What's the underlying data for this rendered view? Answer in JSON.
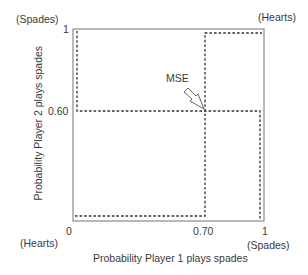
{
  "diagram": {
    "title": "",
    "x_axis": {
      "label": "Probability Player 1 plays spades",
      "ticks": [
        "0",
        "0.70",
        "1"
      ],
      "end_labels": {
        "left": "(Hearts)",
        "right": "(Spades)"
      }
    },
    "y_axis": {
      "label": "Probability Player 2 plays spades",
      "ticks": [
        "0",
        "0.60",
        "1"
      ],
      "end_labels": {
        "top": "(Spades)",
        "bottom": "(Hearts)"
      }
    },
    "corner_labels": {
      "top_left": "(Spades)",
      "top_right": "(Hearts)",
      "bottom_left": "(Hearts)",
      "bottom_right": "(Spades)"
    },
    "annotation": {
      "label": "MSE",
      "points_to": [
        0.7,
        0.6
      ]
    },
    "best_response_player1": [
      [
        0,
        0
      ],
      [
        0.7,
        0
      ],
      [
        0.7,
        1
      ],
      [
        1,
        1
      ]
    ],
    "best_response_player2": [
      [
        0,
        1
      ],
      [
        0,
        0.6
      ],
      [
        1,
        0.6
      ],
      [
        1,
        0
      ]
    ],
    "colors": {
      "frame": "#888888",
      "dotted": "#333333",
      "text": "#3a3a3a"
    }
  },
  "labels": {
    "tick_y_1": "1",
    "tick_y_060": "0.60",
    "tick_x_0": "0",
    "tick_x_070": "0.70",
    "tick_x_1": "1",
    "spades_top": "(Spades)",
    "hearts_top": "(Hearts)",
    "hearts_bottom": "(Hearts)",
    "spades_bottom": "(Spades)",
    "mse": "MSE",
    "xlabel": "Probability Player 1 plays spades",
    "ylabel": "Probability Player 2 plays spades"
  }
}
